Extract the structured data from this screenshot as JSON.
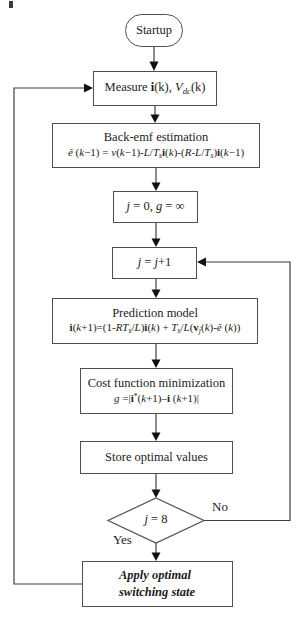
{
  "colors": {
    "background": "#ffffff",
    "line": "#3f3f3f",
    "box_border": "#4f4f4f",
    "text": "#1c1c1c",
    "arrowhead": "#111111"
  },
  "flowchart": {
    "start": {
      "label": "Startup"
    },
    "measure": {
      "rich": [
        {
          "t": "Measure "
        },
        {
          "t": "i",
          "s": "b"
        },
        {
          "t": "(k), "
        },
        {
          "t": "V",
          "s": "i"
        },
        {
          "t": "dc",
          "s": "i sub"
        },
        {
          "t": "(k)"
        }
      ]
    },
    "backemf": {
      "title": "Back-emf estimation",
      "equation": [
        {
          "t": "ê",
          "s": "i"
        },
        {
          "t": " ("
        },
        {
          "t": "k",
          "s": "i"
        },
        {
          "t": "−1) = "
        },
        {
          "t": "v",
          "s": "i"
        },
        {
          "t": "("
        },
        {
          "t": "k",
          "s": "i"
        },
        {
          "t": "−1)-"
        },
        {
          "t": "L",
          "s": "i"
        },
        {
          "t": "/"
        },
        {
          "t": "T",
          "s": "i"
        },
        {
          "t": "s",
          "s": "i sub"
        },
        {
          "t": "i",
          "s": "b"
        },
        {
          "t": "("
        },
        {
          "t": "k",
          "s": "i"
        },
        {
          "t": ")-("
        },
        {
          "t": "R",
          "s": "i"
        },
        {
          "t": "-"
        },
        {
          "t": "L",
          "s": "i"
        },
        {
          "t": "/"
        },
        {
          "t": "T",
          "s": "i"
        },
        {
          "t": "s",
          "s": "i sub"
        },
        {
          "t": ")"
        },
        {
          "t": "i",
          "s": "b"
        },
        {
          "t": "("
        },
        {
          "t": "k",
          "s": "i"
        },
        {
          "t": "−1)"
        }
      ]
    },
    "init": {
      "rich": [
        {
          "t": "j",
          "s": "i"
        },
        {
          "t": " = 0, "
        },
        {
          "t": "g",
          "s": "i"
        },
        {
          "t": " = ∞"
        }
      ]
    },
    "increment": {
      "rich": [
        {
          "t": "j",
          "s": "i"
        },
        {
          "t": " = "
        },
        {
          "t": "j",
          "s": "i"
        },
        {
          "t": "+1"
        }
      ]
    },
    "prediction": {
      "title": "Prediction model",
      "equation": [
        {
          "t": "i",
          "s": "b"
        },
        {
          "t": "("
        },
        {
          "t": "k",
          "s": "i"
        },
        {
          "t": "+1)=(1-"
        },
        {
          "t": "RT",
          "s": "i"
        },
        {
          "t": "s",
          "s": "i sub"
        },
        {
          "t": "/"
        },
        {
          "t": "L",
          "s": "i"
        },
        {
          "t": ")"
        },
        {
          "t": "i",
          "s": "b"
        },
        {
          "t": "("
        },
        {
          "t": "k",
          "s": "i"
        },
        {
          "t": ") + "
        },
        {
          "t": "T",
          "s": "i"
        },
        {
          "t": "s",
          "s": "i sub"
        },
        {
          "t": "/"
        },
        {
          "t": "L",
          "s": "i"
        },
        {
          "t": "("
        },
        {
          "t": "v",
          "s": "b"
        },
        {
          "t": "j",
          "s": "i sub"
        },
        {
          "t": "("
        },
        {
          "t": "k",
          "s": "i"
        },
        {
          "t": ")-"
        },
        {
          "t": "ê",
          "s": "i"
        },
        {
          "t": " ("
        },
        {
          "t": "k",
          "s": "i"
        },
        {
          "t": "))"
        }
      ]
    },
    "cost": {
      "title": "Cost function minimization",
      "equation": [
        {
          "t": "g",
          "s": "i"
        },
        {
          "t": " =|"
        },
        {
          "t": "i",
          "s": "b"
        },
        {
          "t": "*",
          "s": "sup"
        },
        {
          "t": "("
        },
        {
          "t": "k",
          "s": "i"
        },
        {
          "t": "+1)–"
        },
        {
          "t": "i",
          "s": "b"
        },
        {
          "t": " ("
        },
        {
          "t": "k",
          "s": "i"
        },
        {
          "t": "+1)|"
        }
      ]
    },
    "store": {
      "label": "Store optimal values"
    },
    "decision": {
      "rich": [
        {
          "t": "j",
          "s": "i"
        },
        {
          "t": " = 8"
        }
      ]
    },
    "branch_no": {
      "label": "No"
    },
    "branch_yes": {
      "label": "Yes"
    },
    "apply": {
      "line1": "Apply optimal",
      "line2": "switching state"
    }
  }
}
